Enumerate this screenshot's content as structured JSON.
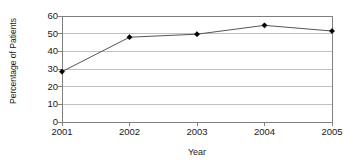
{
  "chart_data": {
    "type": "line",
    "title": "",
    "xlabel": "Year",
    "ylabel": "Percentage of Patients",
    "categories": [
      "2001",
      "2002",
      "2003",
      "2004",
      "2005"
    ],
    "values": [
      28.5,
      48.0,
      49.7,
      54.7,
      51.5
    ],
    "series": [
      {
        "name": "Percentage of Patients",
        "values": [
          28.5,
          48.0,
          49.7,
          54.7,
          51.5
        ]
      }
    ],
    "ylim": [
      0,
      60
    ],
    "ytick_labels": [
      "0",
      "10",
      "20",
      "30",
      "40",
      "50",
      "60"
    ],
    "ytick_values": [
      0,
      10,
      20,
      30,
      40,
      50,
      60
    ],
    "xtick_labels": [
      "2001",
      "2002",
      "2003",
      "2004",
      "2005"
    ],
    "grid": "horizontal",
    "legend": "none",
    "marker": "diamond",
    "line_color": "#555555",
    "marker_color": "#000000",
    "grid_color": "#bfbfbf",
    "axis_color": "#808080",
    "background_color": "#ffffff"
  }
}
